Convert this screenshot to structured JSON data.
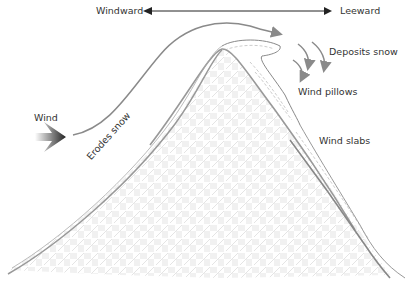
{
  "diagram": {
    "title_axis": {
      "left": "Windward",
      "right": "Leeward"
    },
    "labels": {
      "wind": "Wind",
      "erodes": "Erodes snow",
      "deposits": "Deposits snow",
      "pillows": "Wind pillows",
      "slabs": "Wind slabs"
    },
    "colors": {
      "line": "#8a8a8a",
      "mountain_outline": "#999999",
      "text": "#333333",
      "arrow_dark": "#222222"
    }
  }
}
